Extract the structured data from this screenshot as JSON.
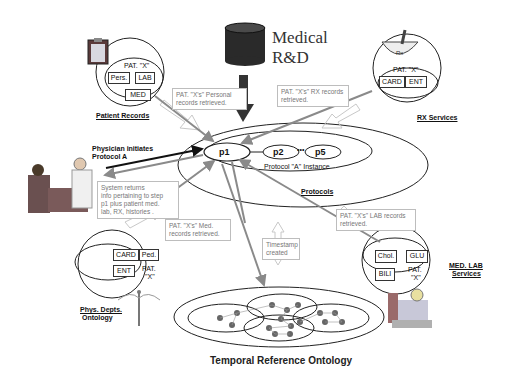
{
  "title": {
    "line1": "Medical",
    "line2": "R&D"
  },
  "patient_records": {
    "label": "Patient Records",
    "patient": "PAT. \"X\"",
    "boxes": [
      "Pers.",
      "LAB",
      "MED"
    ],
    "note": [
      "PAT. \"X's\" Personal",
      "records retrieved."
    ]
  },
  "rx_services": {
    "label": "RX Services",
    "patient": "PAT. \"X\"",
    "boxes": [
      "CARD",
      "ENT"
    ],
    "note": [
      "PAT. \"X's\" RX records",
      "retrieved."
    ]
  },
  "physician": {
    "label": [
      "Physician initiates",
      "Protocol A"
    ],
    "note": [
      "System returns",
      "info pertaining to step",
      "p1 plus patient med.",
      "lab, RX, histories ."
    ]
  },
  "protocols": {
    "label": "Protocols",
    "instance_label": "Protocol \"A\" Instance",
    "steps": [
      "p1",
      "p2",
      "p5"
    ],
    "ellipsis": "•••"
  },
  "phys_depts": {
    "label": [
      "Phys. Depts.",
      "Ontology"
    ],
    "patient": [
      "PAT.",
      "\"X\""
    ],
    "boxes": [
      "CARD",
      "Ped.",
      "ENT"
    ],
    "note": [
      "PAT. \"X's\" Med.",
      "records retrieved."
    ]
  },
  "med_lab": {
    "label": [
      "MED. LAB",
      "Services"
    ],
    "patient": [
      "PAT.",
      "\"X\""
    ],
    "boxes": [
      "Chol.",
      "GLU",
      "BILI"
    ],
    "note": [
      "PAT. \"X's\" LAB records",
      "retrieved."
    ]
  },
  "timestamp": {
    "note": [
      "Timestamp",
      "created"
    ]
  },
  "temporal": {
    "label": "Temporal Reference Ontology"
  },
  "colors": {
    "arrow_gray": "#8a8a8a",
    "arrow_dark": "#222222",
    "db_fill": "#2a2a2a",
    "node_fill": "#666666"
  }
}
